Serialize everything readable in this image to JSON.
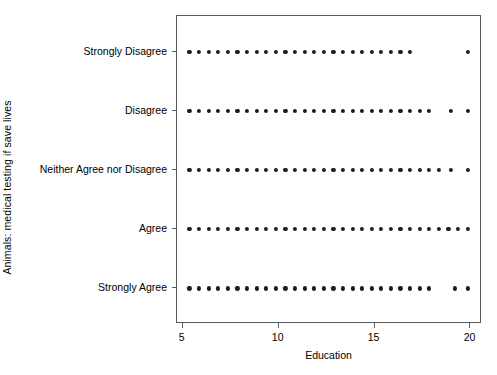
{
  "chart_data": {
    "type": "scatter",
    "title": "",
    "xlabel": "Education",
    "ylabel": "Animals: medical testing if save lives",
    "xlim": [
      4.7,
      20.6
    ],
    "ylim": [
      0.4,
      5.6
    ],
    "grid": false,
    "legend": "none",
    "xticks": [
      5,
      10,
      15,
      20
    ],
    "xticklabels": [
      "5",
      "10",
      "15",
      "20"
    ],
    "yticks": [
      5,
      4,
      3,
      2,
      1
    ],
    "yticklabels": [
      "Strongly Disagree",
      "Disagree",
      "Neither Agree nor Disagree",
      "Agree",
      "Strongly Agree"
    ],
    "marker": "filled-circle",
    "marker_color": "#1c1c1c",
    "marker_size_px": 4.2,
    "series": [
      {
        "name": "Strongly Disagree",
        "y_category": "Strongly Disagree",
        "y_index": 5,
        "x": [
          5.35,
          5.85,
          6.35,
          6.85,
          7.35,
          7.85,
          8.35,
          8.85,
          9.35,
          9.85,
          10.35,
          10.85,
          11.35,
          11.85,
          12.35,
          12.85,
          13.35,
          13.85,
          14.35,
          14.85,
          15.35,
          15.85,
          16.35,
          16.85,
          19.85
        ]
      },
      {
        "name": "Disagree",
        "y_category": "Disagree",
        "y_index": 4,
        "x": [
          5.35,
          5.85,
          6.35,
          6.85,
          7.35,
          7.85,
          8.35,
          8.85,
          9.35,
          9.85,
          10.35,
          10.85,
          11.35,
          11.85,
          12.35,
          12.85,
          13.35,
          13.85,
          14.35,
          14.85,
          15.35,
          15.85,
          16.35,
          16.85,
          17.35,
          17.85,
          19.0,
          19.85
        ]
      },
      {
        "name": "Neither Agree nor Disagree",
        "y_category": "Neither Agree nor Disagree",
        "y_index": 3,
        "x": [
          5.35,
          5.85,
          6.35,
          6.85,
          7.35,
          7.85,
          8.35,
          8.85,
          9.35,
          9.85,
          10.35,
          10.85,
          11.35,
          11.85,
          12.35,
          12.85,
          13.35,
          13.85,
          14.35,
          14.85,
          15.35,
          15.85,
          16.35,
          16.85,
          17.35,
          17.85,
          18.35,
          19.0,
          19.85
        ]
      },
      {
        "name": "Agree",
        "y_category": "Agree",
        "y_index": 2,
        "x": [
          5.35,
          5.85,
          6.35,
          6.85,
          7.35,
          7.85,
          8.35,
          8.85,
          9.35,
          9.85,
          10.35,
          10.85,
          11.35,
          11.85,
          12.35,
          12.85,
          13.35,
          13.85,
          14.35,
          14.85,
          15.35,
          15.85,
          16.35,
          16.85,
          17.35,
          17.85,
          18.35,
          18.85,
          19.35,
          19.85
        ]
      },
      {
        "name": "Strongly Agree",
        "y_category": "Strongly Agree",
        "y_index": 1,
        "x": [
          5.35,
          5.85,
          6.35,
          6.85,
          7.35,
          7.85,
          8.35,
          8.85,
          9.35,
          9.85,
          10.35,
          10.85,
          11.35,
          11.85,
          12.35,
          12.85,
          13.35,
          13.85,
          14.35,
          14.85,
          15.35,
          15.85,
          16.35,
          16.85,
          17.35,
          17.85,
          19.2,
          19.85
        ]
      }
    ]
  },
  "figure": {
    "panel": {
      "left": 176,
      "top": 15,
      "width": 305,
      "height": 308
    },
    "axis_color": "#5a5a5a",
    "background": "#ffffff"
  }
}
